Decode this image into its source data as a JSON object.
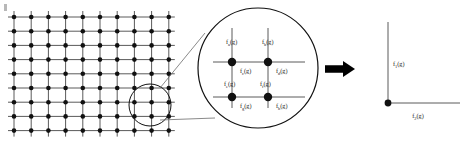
{
  "figure": {
    "background_color": "#ffffff",
    "line_color": "#5a5a5a",
    "node_color": "#111111",
    "text_color": "#1a1a1a"
  },
  "lattice": {
    "name": "square-lattice",
    "columns": 10,
    "rows": 9,
    "x0": 14,
    "y0": 17,
    "dx": 17.2,
    "dy": 14.2,
    "node_radius": 2.3,
    "overhang": 6
  },
  "selection": {
    "name": "selection-circle",
    "cx": 150,
    "cy": 105,
    "r": 21
  },
  "magnifier": {
    "name": "magnifier-circle",
    "cx": 258,
    "cy": 68,
    "r": 60,
    "cross": {
      "vx_left": 232,
      "vx_right": 268,
      "hy_top": 62,
      "hy_bottom": 97,
      "v_top": 28,
      "v_bottom": 108,
      "h_left": 213,
      "h_right": 305
    },
    "nodes": [
      {
        "x": 232,
        "y": 62
      },
      {
        "x": 268,
        "y": 62
      },
      {
        "x": 232,
        "y": 97
      },
      {
        "x": 268,
        "y": 97
      }
    ],
    "labels": [
      {
        "name": "bond-label-vertical-upper-left",
        "base": "f",
        "sub": "a",
        "arg": "(g)",
        "x": 226,
        "y": 44,
        "anchor": "start"
      },
      {
        "name": "bond-label-vertical-upper-right",
        "base": "f",
        "sub": "b",
        "arg": "(g)",
        "x": 262,
        "y": 44,
        "anchor": "start"
      },
      {
        "name": "bond-label-horizontal-middle-left",
        "base": "f",
        "sub": "c",
        "arg": "(g)",
        "x": 240,
        "y": 73,
        "anchor": "start"
      },
      {
        "name": "bond-label-horizontal-middle-right",
        "base": "f",
        "sub": "d",
        "arg": "(g)",
        "x": 276,
        "y": 73,
        "anchor": "start"
      },
      {
        "name": "bond-label-vertical-lower-left",
        "base": "f",
        "sub": "e",
        "arg": "(g)",
        "x": 224,
        "y": 86,
        "anchor": "start"
      },
      {
        "name": "bond-label-vertical-lower-right",
        "base": "f",
        "sub": "f",
        "arg": "(g)",
        "x": 260,
        "y": 86,
        "anchor": "start"
      },
      {
        "name": "bond-label-horizontal-bottom-left",
        "base": "f",
        "sub": "g",
        "arg": "(g)",
        "x": 240,
        "y": 108,
        "anchor": "start"
      },
      {
        "name": "bond-label-horizontal-bottom-right",
        "base": "f",
        "sub": "h",
        "arg": "(g)",
        "x": 276,
        "y": 108,
        "anchor": "start"
      }
    ]
  },
  "connectors": [
    {
      "name": "magnifier-connector-upper",
      "x1": 160,
      "y1": 88,
      "x2": 205,
      "y2": 33
    },
    {
      "name": "magnifier-connector-lower",
      "x1": 160,
      "y1": 120,
      "x2": 215,
      "y2": 118
    }
  ],
  "arrow": {
    "name": "transform-arrow",
    "x": 325,
    "y": 61,
    "width": 30,
    "height": 16,
    "color": "#000000"
  },
  "reduced": {
    "name": "reduced-vertex-diagram",
    "origin_x": 388,
    "origin_y": 103,
    "v_top": 22,
    "h_right": 460,
    "node_radius": 3.4,
    "labels": [
      {
        "name": "reduced-label-vertical",
        "base": "f",
        "sub": "1",
        "arg": "(g)",
        "x": 393,
        "y": 66,
        "anchor": "start"
      },
      {
        "name": "reduced-label-horizontal",
        "base": "f",
        "sub": "2",
        "arg": "(g)",
        "x": 418,
        "y": 118,
        "anchor": "middle"
      }
    ]
  },
  "corner_mark": {
    "name": "corner-artifact",
    "x": 4,
    "y": 4,
    "width": 3,
    "height": 7
  }
}
